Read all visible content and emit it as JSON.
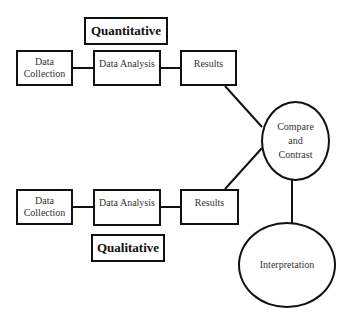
{
  "diagram": {
    "type": "flowchart",
    "labels": {
      "quantitative": "Quantitative",
      "qualitative": "Qualitative"
    },
    "quantitative_row": {
      "data_collection": "Data\nCollection",
      "data_analysis": "Data Analysis",
      "results": "Results"
    },
    "qualitative_row": {
      "data_collection": "Data\nCollection",
      "data_analysis": "Data Analysis",
      "results": "Results"
    },
    "compare": "Compare\nand\nContrast",
    "interpretation": "Interpretation",
    "edges": [
      {
        "from": "quant-data-collection",
        "to": "quant-data-analysis"
      },
      {
        "from": "quant-data-analysis",
        "to": "quant-results"
      },
      {
        "from": "quant-results",
        "to": "compare-and-contrast"
      },
      {
        "from": "qual-data-collection",
        "to": "qual-data-analysis"
      },
      {
        "from": "qual-data-analysis",
        "to": "qual-results"
      },
      {
        "from": "qual-results",
        "to": "compare-and-contrast"
      },
      {
        "from": "compare-and-contrast",
        "to": "interpretation"
      }
    ]
  }
}
